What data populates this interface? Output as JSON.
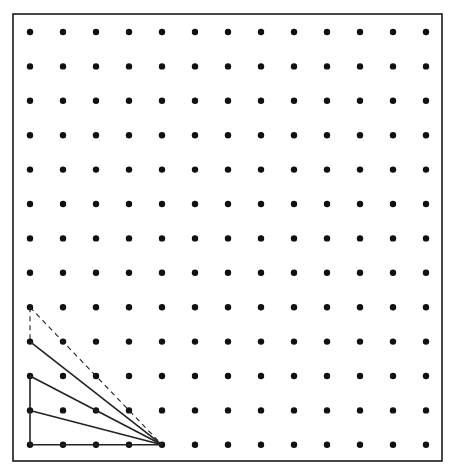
{
  "diagram": {
    "type": "geoboard-dot-grid",
    "frame": {
      "x": 13,
      "y": 14,
      "width": 429,
      "height": 447,
      "stroke": "#1a1a1a"
    },
    "grid": {
      "columns": 13,
      "rows": 13,
      "origin_x": 30,
      "origin_y": 32,
      "spacing_x": 33.0,
      "spacing_y": 34.4,
      "dot_radius": 3.2,
      "dot_color": "#111111"
    },
    "figure": {
      "apex_grid": [
        4,
        12
      ],
      "solid_segments_grid": [
        [
          [
            0,
            12
          ],
          [
            4,
            12
          ]
        ],
        [
          [
            0,
            12
          ],
          [
            0,
            10
          ]
        ],
        [
          [
            0,
            11
          ],
          [
            4,
            12
          ]
        ],
        [
          [
            0,
            10
          ],
          [
            4,
            12
          ]
        ],
        [
          [
            0,
            9
          ],
          [
            4,
            12
          ]
        ]
      ],
      "dashed_segments_grid": [
        [
          [
            0,
            8
          ],
          [
            4,
            12
          ]
        ],
        [
          [
            0,
            8
          ],
          [
            0,
            9
          ]
        ]
      ],
      "line_color": "#222222"
    }
  }
}
